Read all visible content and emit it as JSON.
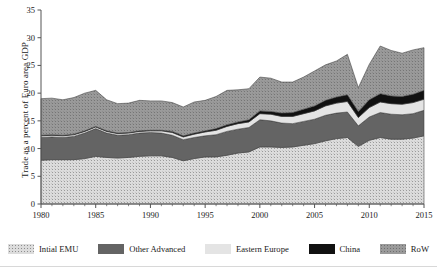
{
  "figure": {
    "ylabel": "Trade as a percent of Euro area GDP"
  },
  "legend": {
    "items": [
      {
        "label": "Intial EMU",
        "key": "initial_emu",
        "color": "#d8d8d8",
        "pattern": "dots-light"
      },
      {
        "label": "Other Advanced",
        "key": "other_advanced",
        "color": "#646464",
        "pattern": "solid"
      },
      {
        "label": "Eastern Europe",
        "key": "eastern_europe",
        "color": "#e4e4e4",
        "pattern": "solid"
      },
      {
        "label": "China",
        "key": "china",
        "color": "#111111",
        "pattern": "solid"
      },
      {
        "label": "RoW",
        "key": "row",
        "color": "#9a9a9a",
        "pattern": "dots-mid"
      }
    ]
  },
  "chart_data": {
    "type": "area",
    "stacked": true,
    "title": "",
    "xlabel": "",
    "ylabel": "Trade as a percent of Euro area GDP",
    "xlim": [
      1980,
      2015
    ],
    "ylim": [
      0,
      35
    ],
    "ytick_labels": [
      "0",
      "5",
      "10",
      "15",
      "20",
      "25",
      "30",
      "35"
    ],
    "yticks": [
      0,
      5,
      10,
      15,
      20,
      25,
      30,
      35
    ],
    "xtick_labels": [
      "1980",
      "1985",
      "1990",
      "1995",
      "2000",
      "2005",
      "2010",
      "2015"
    ],
    "xticks": [
      1980,
      1985,
      1990,
      1995,
      2000,
      2005,
      2010,
      2015
    ],
    "x_minor_tick_step": 1,
    "grid": false,
    "legend_position": "bottom",
    "x": [
      1980,
      1981,
      1982,
      1983,
      1984,
      1985,
      1986,
      1987,
      1988,
      1989,
      1990,
      1991,
      1992,
      1993,
      1994,
      1995,
      1996,
      1997,
      1998,
      1999,
      2000,
      2001,
      2002,
      2003,
      2004,
      2005,
      2006,
      2007,
      2008,
      2009,
      2010,
      2011,
      2012,
      2013,
      2014,
      2015
    ],
    "series": [
      {
        "name": "Intial EMU",
        "values": [
          7.9,
          8.0,
          8.0,
          8.0,
          8.2,
          8.6,
          8.4,
          8.3,
          8.4,
          8.6,
          8.7,
          8.7,
          8.4,
          7.8,
          8.2,
          8.5,
          8.5,
          8.8,
          9.2,
          9.4,
          10.3,
          10.3,
          10.2,
          10.3,
          10.6,
          10.9,
          11.4,
          11.8,
          12.0,
          10.4,
          11.5,
          12.0,
          11.7,
          11.7,
          11.9,
          12.3
        ]
      },
      {
        "name": "Other Advanced",
        "values": [
          4.1,
          4.1,
          4.0,
          4.2,
          4.6,
          5.0,
          4.4,
          4.1,
          4.1,
          4.2,
          4.2,
          4.1,
          4.0,
          3.8,
          3.8,
          3.8,
          4.0,
          4.3,
          4.3,
          4.4,
          4.9,
          4.7,
          4.4,
          4.2,
          4.3,
          4.4,
          4.6,
          4.6,
          4.6,
          3.7,
          4.2,
          4.5,
          4.5,
          4.4,
          4.4,
          4.6
        ]
      },
      {
        "name": "Eastern Europe",
        "values": [
          0.3,
          0.3,
          0.3,
          0.3,
          0.3,
          0.3,
          0.3,
          0.3,
          0.3,
          0.3,
          0.3,
          0.4,
          0.5,
          0.5,
          0.6,
          0.7,
          0.8,
          0.9,
          1.0,
          1.0,
          1.1,
          1.2,
          1.2,
          1.3,
          1.4,
          1.5,
          1.7,
          1.8,
          1.9,
          1.5,
          1.7,
          1.9,
          1.9,
          1.9,
          2.0,
          2.0
        ]
      },
      {
        "name": "China",
        "values": [
          0.1,
          0.1,
          0.1,
          0.1,
          0.1,
          0.1,
          0.1,
          0.1,
          0.1,
          0.1,
          0.1,
          0.1,
          0.2,
          0.2,
          0.2,
          0.2,
          0.3,
          0.3,
          0.3,
          0.4,
          0.5,
          0.5,
          0.6,
          0.7,
          0.8,
          0.9,
          1.0,
          1.1,
          1.2,
          1.1,
          1.4,
          1.5,
          1.4,
          1.4,
          1.5,
          1.6
        ]
      },
      {
        "name": "RoW",
        "values": [
          6.6,
          6.6,
          6.4,
          6.6,
          6.8,
          6.5,
          5.6,
          5.3,
          5.3,
          5.5,
          5.3,
          5.3,
          5.2,
          5.2,
          5.6,
          5.5,
          5.8,
          6.2,
          5.8,
          5.6,
          6.1,
          6.0,
          5.6,
          5.5,
          5.8,
          6.3,
          6.4,
          6.5,
          7.3,
          4.3,
          6.4,
          8.6,
          8.2,
          7.8,
          8.0,
          7.7
        ]
      }
    ],
    "totals": [
      19.0,
      19.1,
      18.8,
      19.2,
      20.0,
      20.5,
      18.8,
      18.1,
      18.2,
      18.7,
      18.6,
      18.6,
      18.3,
      17.5,
      18.4,
      18.7,
      19.4,
      20.5,
      20.6,
      20.8,
      22.9,
      22.7,
      22.0,
      22.0,
      22.9,
      24.0,
      25.1,
      25.8,
      27.0,
      21.0,
      25.2,
      28.5,
      27.7,
      27.2,
      27.8,
      28.2
    ]
  }
}
